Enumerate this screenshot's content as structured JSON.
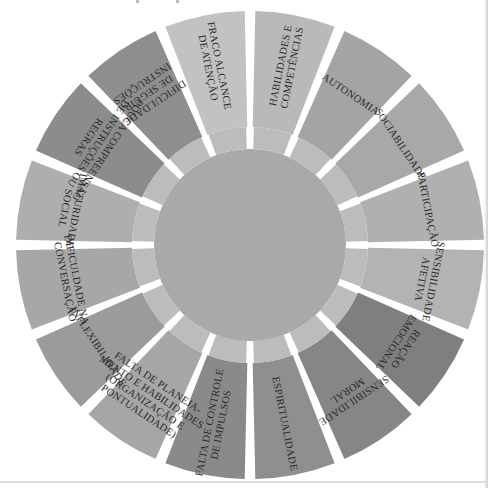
{
  "diagram": {
    "type": "radial-wheel",
    "center": [
      250,
      245
    ],
    "outer_radius": 234,
    "ring_outer_radius": 118,
    "inner_radius": 96,
    "colors": {
      "background": "#ffffff",
      "gap": "#ffffff",
      "center_disk": "#a9a9a9",
      "ring": "#bcbcbc",
      "text": "#2a2a2a"
    },
    "segments": [
      {
        "label": [
          "HABILIDADES E",
          "COMPETÊNCIAS"
        ],
        "fill": "#b9b9b9"
      },
      {
        "label": [
          "AUTONOMIA"
        ],
        "fill": "#a4a4a4"
      },
      {
        "label": [
          "SOCIABILIDADE"
        ],
        "fill": "#a8a8a8"
      },
      {
        "label": [
          "PARTICIPAÇÃO"
        ],
        "fill": "#b0b0b0"
      },
      {
        "label": [
          "SENSIBILIDADE",
          "AFETIVA"
        ],
        "fill": "#b3b3b3"
      },
      {
        "label": [
          "REAÇÃO",
          "EMOCIONAL"
        ],
        "fill": "#7f7f7f"
      },
      {
        "label": [
          "SENSIBILIDADE",
          "MORAL"
        ],
        "fill": "#868686"
      },
      {
        "label": [
          "ESPIRITUALIDADE"
        ],
        "fill": "#8f8f8f"
      },
      {
        "label": [
          "FALTA DE CONTROLE",
          "DE IMPULSOS"
        ],
        "fill": "#8a8a8a"
      },
      {
        "label": [
          "FALTA DE PLANEJA-",
          "MENTO E HABILIDADES",
          "(ORGANIZAÇÃO E",
          "PONTUALIDADE)"
        ],
        "fill": "#a6a6a6"
      },
      {
        "label": [
          "INFLEXIBILIDADE"
        ],
        "fill": "#9b9b9b"
      },
      {
        "label": [
          "DIFICULDADE NA",
          "CONVERSAÇÃO"
        ],
        "fill": "#a7a7a7"
      },
      {
        "label": [
          "IMATURIDADE",
          "SOCIAL"
        ],
        "fill": "#aeaeae"
      },
      {
        "label": [
          "POUCA COMPREENSÃO",
          "DE INSTRUÇÕES OU",
          "REGRAS"
        ],
        "fill": "#8c8c8c"
      },
      {
        "label": [
          "DIFICULDADE",
          "DE SEGUIR",
          "INSTRUÇÕES"
        ],
        "fill": "#8e8e8e"
      },
      {
        "label": [
          "FRACO ALCANCE",
          "DE ATENÇÃO"
        ],
        "fill": "#c2c2c2"
      }
    ]
  }
}
